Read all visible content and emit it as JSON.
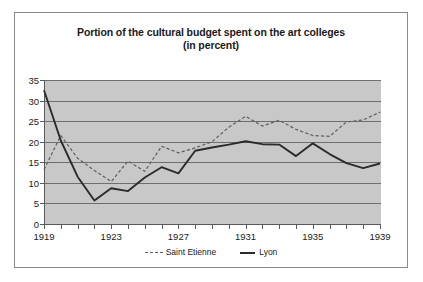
{
  "figure": {
    "title_line1": "Portion of the cultural budget spent on the art colleges",
    "title_line2": "(in percent)",
    "plot_background": "#c8c8c8",
    "frame_color": "#8a8a8a"
  },
  "legend": {
    "entries": [
      {
        "label": "Saint Etienne",
        "style": "dashed",
        "color": "#5e5e5e"
      },
      {
        "label": "Lyon",
        "style": "solid",
        "color": "#2b2b2b"
      }
    ]
  },
  "axes": {
    "y_ticks": [
      "35",
      "30",
      "25",
      "20",
      "15",
      "10",
      "5",
      "0"
    ],
    "x_ticks": [
      "1919",
      "1923",
      "1927",
      "1931",
      "1935",
      "1939"
    ]
  },
  "chart_data": {
    "type": "line",
    "title": "Portion of the cultural budget spent on the art colleges (in percent)",
    "xlabel": "",
    "ylabel": "",
    "ylim": [
      0,
      35
    ],
    "xlim": [
      1919,
      1939
    ],
    "ytick_values": [
      0,
      5,
      10,
      15,
      20,
      25,
      30,
      35
    ],
    "xtick_values": [
      1919,
      1923,
      1927,
      1931,
      1935,
      1939
    ],
    "grid": "horizontal",
    "legend_position": "bottom-center",
    "x": [
      1919,
      1920,
      1921,
      1922,
      1923,
      1924,
      1925,
      1926,
      1927,
      1928,
      1929,
      1930,
      1931,
      1932,
      1933,
      1934,
      1935,
      1936,
      1937,
      1938,
      1939
    ],
    "series": [
      {
        "name": "Saint Etienne",
        "style": "dashed",
        "color": "#5e5e5e",
        "values": [
          13.2,
          21.5,
          16.0,
          13.0,
          10.3,
          15.3,
          12.8,
          18.9,
          17.3,
          18.5,
          20.0,
          23.5,
          26.2,
          23.8,
          25.2,
          23.0,
          21.5,
          21.3,
          24.8,
          25.3,
          27.2
        ]
      },
      {
        "name": "Lyon",
        "style": "solid",
        "color": "#2b2b2b",
        "values": [
          32.5,
          20.3,
          11.5,
          5.7,
          8.7,
          8.0,
          11.3,
          13.8,
          12.3,
          17.8,
          18.6,
          19.3,
          20.1,
          19.4,
          19.3,
          16.5,
          19.6,
          17.0,
          14.8,
          13.6,
          14.7
        ]
      }
    ]
  }
}
